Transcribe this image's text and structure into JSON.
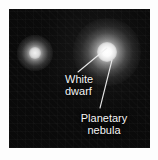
{
  "figure": {
    "kind": "astronomy-photo-annotated",
    "background_color": "#ffffff",
    "sky_color": "#0a0a0a",
    "label_color": "#f4f4f4",
    "objects": [
      {
        "name": "planetary-nebula-with-white-dwarf",
        "center": [
          107,
          52
        ],
        "glow_radius": 34,
        "core_radius": 10,
        "brightness": "bright"
      },
      {
        "name": "companion-star",
        "center": [
          35,
          53
        ],
        "glow_radius": 18,
        "core_radius": 6,
        "brightness": "faint"
      }
    ],
    "annotations": [
      {
        "id": "white-dwarf",
        "line1": "White",
        "line2": "dwarf",
        "leader_from": [
          107,
          48
        ],
        "leader_to": [
          78,
          72
        ]
      },
      {
        "id": "planetary-nebula",
        "line1": "Planetary",
        "line2": "nebula",
        "leader_from": [
          112,
          60
        ],
        "leader_to": [
          100,
          108
        ]
      }
    ]
  }
}
